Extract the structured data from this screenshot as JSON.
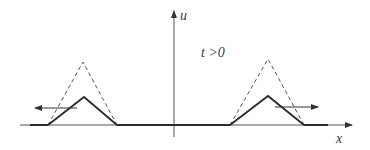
{
  "diagram": {
    "axes": {
      "x_label": "x",
      "y_label": "u"
    },
    "annotation": "t >0",
    "colors": {
      "stroke": "#2b2b2b",
      "axis": "#555555",
      "dashed": "#555555",
      "background": "#ffffff"
    },
    "pulses": [
      {
        "name": "left-pulse",
        "direction": "left",
        "solid_triangle": {
          "left": 48,
          "peak_x": 84,
          "peak_y": 97,
          "right": 117
        },
        "dashed_triangle": {
          "left": 48,
          "peak_x": 83,
          "peak_y": 62,
          "right": 117
        }
      },
      {
        "name": "right-pulse",
        "direction": "right",
        "solid_triangle": {
          "left": 230,
          "peak_x": 268,
          "peak_y": 96,
          "right": 304
        },
        "dashed_triangle": {
          "left": 230,
          "peak_x": 268,
          "peak_y": 59,
          "right": 304
        }
      }
    ]
  }
}
